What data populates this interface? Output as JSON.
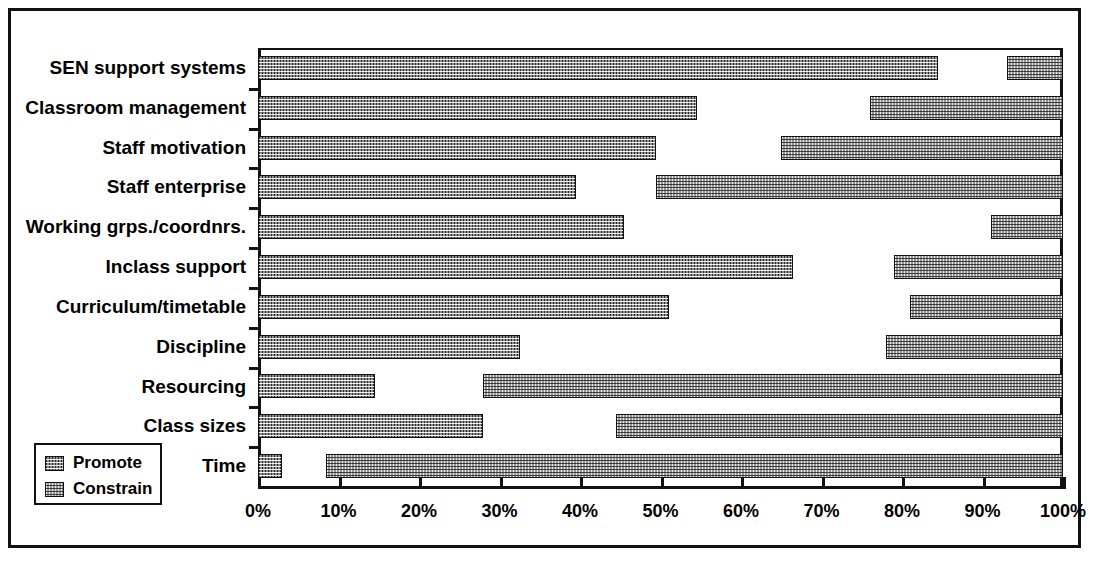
{
  "chart_data": {
    "type": "bar",
    "orientation": "horizontal",
    "title": "",
    "subtitle": "",
    "xlabel": "",
    "ylabel": "",
    "xlim": [
      0,
      100
    ],
    "xticks": [
      0,
      10,
      20,
      30,
      40,
      50,
      60,
      70,
      80,
      90,
      100
    ],
    "xticklabels": [
      "0%",
      "10%",
      "20%",
      "30%",
      "40%",
      "50%",
      "60%",
      "70%",
      "80%",
      "90%",
      "100%"
    ],
    "grid": false,
    "legend_position": "lower-left",
    "categories": [
      "SEN support systems",
      "Classroom management",
      "Staff motivation",
      "Staff enterprise",
      "Working grps./coordnrs.",
      "Inclass support",
      "Curriculum/timetable",
      "Discipline",
      "Resourcing",
      "Class sizes",
      "Time"
    ],
    "series": [
      {
        "name": "Promote",
        "note": "bar starts at 0% and extends rightwards to the listed value",
        "values": [
          84.5,
          54.5,
          49.5,
          39.5,
          45.5,
          66.5,
          51.0,
          32.5,
          14.5,
          28.0,
          3.0
        ]
      },
      {
        "name": "Constrain",
        "note": "bar starts at the listed value and extends rightwards to 100%",
        "values": [
          93.0,
          76.0,
          65.0,
          49.5,
          91.0,
          79.0,
          81.0,
          78.0,
          28.0,
          44.5,
          8.5
        ]
      }
    ]
  },
  "legend": {
    "items": [
      {
        "label": "Promote",
        "swatch": "dark-checker"
      },
      {
        "label": "Constrain",
        "swatch": "light-checker"
      }
    ]
  }
}
